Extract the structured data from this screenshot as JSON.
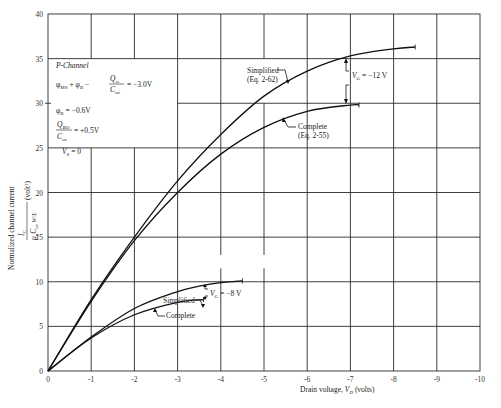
{
  "chart_data": {
    "type": "line",
    "title": "",
    "xlabel": "Drain voltage, V_D (volts)",
    "ylabel": "Normalized channel current  I_C / (μ_p C_ox W/L)  (volt²)",
    "xlim": [
      0,
      -10
    ],
    "ylim": [
      0,
      40
    ],
    "x_ticks": [
      "0",
      "-1",
      "-2",
      "-3",
      "-4",
      "-5",
      "-6",
      "-7",
      "-8",
      "-9",
      "-10"
    ],
    "y_ticks": [
      "0",
      "5",
      "10",
      "15",
      "20",
      "25",
      "30",
      "35",
      "40"
    ],
    "grid": true,
    "series": [
      {
        "name": "Simplified (Eq. 2-62), V_G = -12 V",
        "x": [
          0,
          -1,
          -2,
          -3,
          -4,
          -5,
          -6,
          -7,
          -8,
          -8.5
        ],
        "y": [
          0,
          8.0,
          15.0,
          21.3,
          26.5,
          30.8,
          33.6,
          35.3,
          36.1,
          36.3
        ]
      },
      {
        "name": "Complete (Eq. 2-55), V_G = -12 V",
        "x": [
          0,
          -1,
          -2,
          -3,
          -4,
          -5,
          -6,
          -7,
          -7.2
        ],
        "y": [
          0,
          7.8,
          14.6,
          20.0,
          24.3,
          27.3,
          29.1,
          29.8,
          29.8
        ]
      },
      {
        "name": "Simplified, V_G = -8 V",
        "x": [
          0,
          -1,
          -2,
          -3,
          -3.5,
          -4,
          -4.5
        ],
        "y": [
          0,
          3.8,
          7.0,
          8.9,
          9.5,
          9.9,
          10.1
        ]
      },
      {
        "name": "Complete, V_G = -8 V",
        "x": [
          0,
          -1,
          -2,
          -3,
          -3.6
        ],
        "y": [
          0,
          3.7,
          6.3,
          7.7,
          8.0
        ]
      }
    ],
    "annotations": [
      "P-Channel",
      "φ_MS + φ_B - Q_ss/C_ox = -3.0V",
      "φ_B = -0.6V",
      "Q_BO/C_ox = +0.5V",
      "V_S = 0",
      "V_G = -12 V",
      "V_G = -8 V",
      "Simplified (Eq. 2-62)",
      "Complete (Eq. 2-55)",
      "Simplified",
      "Complete"
    ]
  },
  "labels": {
    "xlabel_main": "Drain voltage, ",
    "xlabel_var": "V",
    "xlabel_sub": "D",
    "xlabel_unit": " (volts)",
    "ylabel_main": "Normalized channel current",
    "legend": {
      "title": "P-Channel",
      "eq1_left": "φ",
      "eq1_text": "φMS + φB − ",
      "eq1_num": "Qss",
      "eq1_den": "Cox",
      "eq1_right": "= −3.0V",
      "eq2": "φB = −0.6V",
      "eq3_num": "QBO",
      "eq3_den": "Cox",
      "eq3_right": "= +0.5V",
      "eq4": "VS = 0"
    },
    "vg12": "VG = −12 V",
    "vg8": "VG = −8 V",
    "simp12_l1": "Simplified",
    "simp12_l2": "(Eq. 2-62)",
    "comp12_l1": "Complete",
    "comp12_l2": "(Eq. 2-55)",
    "simp8": "Simplified",
    "comp8": "Complete"
  }
}
